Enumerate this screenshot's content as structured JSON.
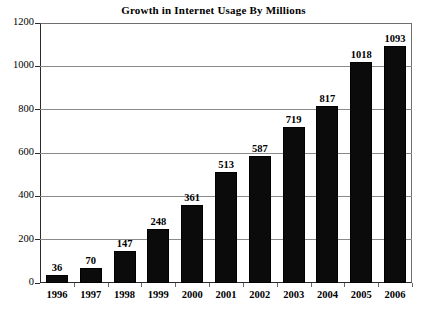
{
  "chart_data": {
    "type": "bar",
    "title": "Growth in Internet Usage By Millions",
    "xlabel": "",
    "ylabel": "",
    "categories": [
      "1996",
      "1997",
      "1998",
      "1999",
      "2000",
      "2001",
      "2002",
      "2003",
      "2004",
      "2005",
      "2006"
    ],
    "values": [
      36,
      70,
      147,
      248,
      361,
      513,
      587,
      719,
      817,
      1018,
      1093
    ],
    "data_labels": [
      "36",
      "70",
      "147",
      "248",
      "361",
      "513",
      "587",
      "719",
      "817",
      "1018",
      "1093"
    ],
    "ylim": [
      0,
      1200
    ],
    "yticks": [
      0,
      200,
      400,
      600,
      800,
      1000,
      1200
    ],
    "ytick_labels": [
      "0",
      "200",
      "400",
      "600",
      "800",
      "1000",
      "1200"
    ],
    "grid": true,
    "grid_axis": "y",
    "legend": false,
    "legend_position": "none",
    "bar_color": "#0b0b0b",
    "grid_color": "#8a8a8a",
    "axis_color": "#2b2b2b",
    "background_color": "#ffffff",
    "text_color": "#000000"
  }
}
